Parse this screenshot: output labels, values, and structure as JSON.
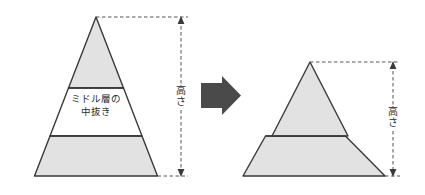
{
  "figure": {
    "background_color": "#ffffff",
    "shape_fill": "#e2e2e2",
    "shape_stroke": "#3a3a3a",
    "dashed_color": "#555555",
    "arrow_color": "#4a4a4a",
    "text_color": "#2b2b2b"
  },
  "left_pyramid": {
    "name": "pyramid-with-middle-layer",
    "top_segment": {
      "label": ""
    },
    "middle_segment": {
      "label_line1": "ミドル層の",
      "label_line2": "中抜き",
      "fill": "#ffffff"
    },
    "bottom_segment": {
      "label": ""
    },
    "height_label": "高さ"
  },
  "transform_arrow": {
    "name": "transform-arrow",
    "direction": "right",
    "color": "#4a4a4a"
  },
  "right_pyramid": {
    "name": "pyramid-middle-removed",
    "top_segment": {
      "label": ""
    },
    "bottom_segment": {
      "label": ""
    },
    "height_label": "高さ"
  }
}
